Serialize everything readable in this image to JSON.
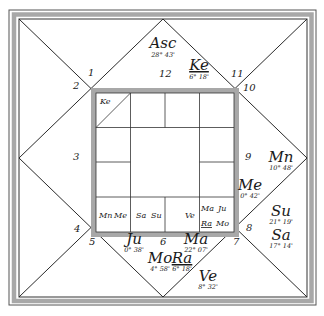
{
  "chart": {
    "type": "north-indian-birth-chart",
    "house_numbers": {
      "h1": "1",
      "h2": "2",
      "h3": "3",
      "h4": "4",
      "h5": "5",
      "h6": "6",
      "h7": "7",
      "h8": "8",
      "h9": "9",
      "h10": "10",
      "h11": "11",
      "h12": "12"
    },
    "planets": {
      "asc": {
        "label": "Asc",
        "degree": "28° 43'"
      },
      "ke": {
        "label": "Ke",
        "degree": "6° 18'"
      },
      "mn": {
        "label": "Mn",
        "degree": "10° 48'"
      },
      "me": {
        "label": "Me",
        "degree": "0° 42'"
      },
      "su": {
        "label": "Su",
        "degree": "21° 19'"
      },
      "sa": {
        "label": "Sa",
        "degree": "17° 14'"
      },
      "ju": {
        "label": "Ju",
        "degree": "0° 38'"
      },
      "ma": {
        "label": "Ma",
        "degree": "22° 07'"
      },
      "mo": {
        "label": "Mo",
        "degree": "4° 58'"
      },
      "ra": {
        "label": "Ra",
        "degree": "6° 18'"
      },
      "ve": {
        "label": "Ve",
        "degree": "8° 32'"
      }
    },
    "inner_grid": {
      "top_left": "Ke",
      "bottom_row": [
        {
          "planets": [
            "Mn",
            "Me"
          ]
        },
        {
          "planets": [
            "Sa",
            "Su"
          ]
        },
        {
          "planets": [
            "Ve"
          ]
        },
        {
          "planets": [
            "Ma",
            "Ju",
            "Ra",
            "Mo"
          ]
        }
      ]
    },
    "colors": {
      "line": "#2a2a2a",
      "frame_band": "#a8a8a8",
      "background": "#ffffff"
    }
  }
}
